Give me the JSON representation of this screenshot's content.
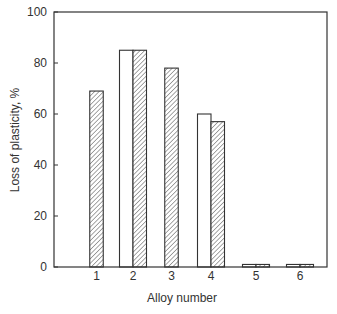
{
  "chart_data": {
    "type": "bar",
    "title": "",
    "xlabel": "Alloy number",
    "ylabel": "Loss of plasticity, %",
    "categories": [
      "1",
      "2",
      "3",
      "4",
      "5",
      "6"
    ],
    "series": [
      {
        "name": "Series A (open bars)",
        "style": "white",
        "values": [
          null,
          85,
          null,
          60,
          1,
          1
        ]
      },
      {
        "name": "Series B (hatched bars)",
        "style": "hatched",
        "values": [
          69,
          85,
          78,
          57,
          1,
          1
        ]
      }
    ],
    "ylim": [
      0,
      100
    ],
    "yticks": [
      0,
      20,
      40,
      60,
      80,
      100
    ],
    "ytick_labels": [
      "0",
      "20",
      "40",
      "60",
      "80",
      "100"
    ],
    "grid": false,
    "legend": "none",
    "colors": {
      "axis": "#333333",
      "bar_fill_open": "#ffffff",
      "hatch": "#777777",
      "bar_edge": "#333333"
    }
  }
}
